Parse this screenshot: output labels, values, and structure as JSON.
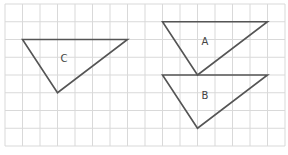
{
  "grid": {
    "origin_x": 5,
    "origin_y": 4,
    "cell_w": 17.5,
    "cell_h": 17.75,
    "cols": 16,
    "rows": 8,
    "line_color": "#d9d9d9"
  },
  "shapes": [
    {
      "id": "C",
      "label": "C",
      "vertices": [
        [
          1,
          2
        ],
        [
          7,
          2
        ],
        [
          3,
          5
        ]
      ],
      "label_pos": [
        64,
        62
      ]
    },
    {
      "id": "A",
      "label": "A",
      "vertices": [
        [
          9,
          1
        ],
        [
          15,
          1
        ],
        [
          11,
          4
        ]
      ],
      "label_pos": [
        205,
        45
      ]
    },
    {
      "id": "B",
      "label": "B",
      "vertices": [
        [
          9,
          4
        ],
        [
          15,
          4
        ],
        [
          11,
          7
        ]
      ],
      "label_pos": [
        205,
        99
      ]
    }
  ],
  "stroke_color": "#555555"
}
